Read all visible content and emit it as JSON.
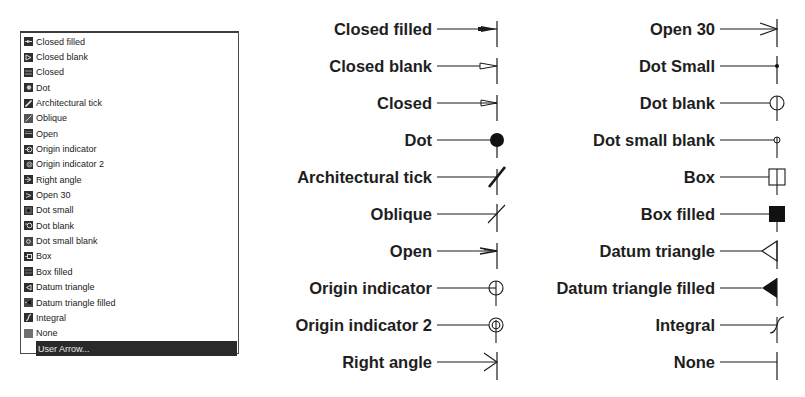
{
  "listbox": {
    "items": [
      {
        "label": "Closed filled",
        "icon": "closed-filled-icon"
      },
      {
        "label": "Closed blank",
        "icon": "closed-blank-icon"
      },
      {
        "label": "Closed",
        "icon": "closed-icon"
      },
      {
        "label": "Dot",
        "icon": "dot-icon"
      },
      {
        "label": "Architectural tick",
        "icon": "architectural-tick-icon"
      },
      {
        "label": "Oblique",
        "icon": "oblique-icon"
      },
      {
        "label": "Open",
        "icon": "open-icon"
      },
      {
        "label": "Origin indicator",
        "icon": "origin-indicator-icon"
      },
      {
        "label": "Origin indicator 2",
        "icon": "origin-indicator-2-icon"
      },
      {
        "label": "Right angle",
        "icon": "right-angle-icon"
      },
      {
        "label": "Open 30",
        "icon": "open-30-icon"
      },
      {
        "label": "Dot small",
        "icon": "dot-small-icon"
      },
      {
        "label": "Dot blank",
        "icon": "dot-blank-icon"
      },
      {
        "label": "Dot small blank",
        "icon": "dot-small-blank-icon"
      },
      {
        "label": "Box",
        "icon": "box-icon"
      },
      {
        "label": "Box filled",
        "icon": "box-filled-icon"
      },
      {
        "label": "Datum triangle",
        "icon": "datum-triangle-icon"
      },
      {
        "label": "Datum triangle filled",
        "icon": "datum-triangle-filled-icon"
      },
      {
        "label": "Integral",
        "icon": "integral-icon"
      },
      {
        "label": "None",
        "icon": "none-icon"
      }
    ],
    "selected_item": {
      "label": "User Arrow..."
    }
  },
  "samples": {
    "left_column": [
      {
        "label": "Closed filled",
        "symbol": "closed-filled"
      },
      {
        "label": "Closed blank",
        "symbol": "closed-blank"
      },
      {
        "label": "Closed",
        "symbol": "closed"
      },
      {
        "label": "Dot",
        "symbol": "dot"
      },
      {
        "label": "Architectural tick",
        "symbol": "architectural-tick"
      },
      {
        "label": "Oblique",
        "symbol": "oblique"
      },
      {
        "label": "Open",
        "symbol": "open"
      },
      {
        "label": "Origin indicator",
        "symbol": "origin-indicator"
      },
      {
        "label": "Origin indicator 2",
        "symbol": "origin-indicator-2"
      },
      {
        "label": "Right angle",
        "symbol": "right-angle"
      }
    ],
    "right_column": [
      {
        "label": "Open 30",
        "symbol": "open-30"
      },
      {
        "label": "Dot Small",
        "symbol": "dot-small"
      },
      {
        "label": "Dot blank",
        "symbol": "dot-blank"
      },
      {
        "label": "Dot small blank",
        "symbol": "dot-small-blank"
      },
      {
        "label": "Box",
        "symbol": "box"
      },
      {
        "label": "Box filled",
        "symbol": "box-filled"
      },
      {
        "label": "Datum triangle",
        "symbol": "datum-triangle"
      },
      {
        "label": "Datum triangle filled",
        "symbol": "datum-triangle-filled"
      },
      {
        "label": "Integral",
        "symbol": "integral"
      },
      {
        "label": "None",
        "symbol": "none"
      }
    ]
  },
  "colors": {
    "stroke": "#1a1a1a",
    "selection_bg": "#2a2a2a",
    "selection_text": "#e8e8e8",
    "icon_bg": "#2e2e2e"
  }
}
